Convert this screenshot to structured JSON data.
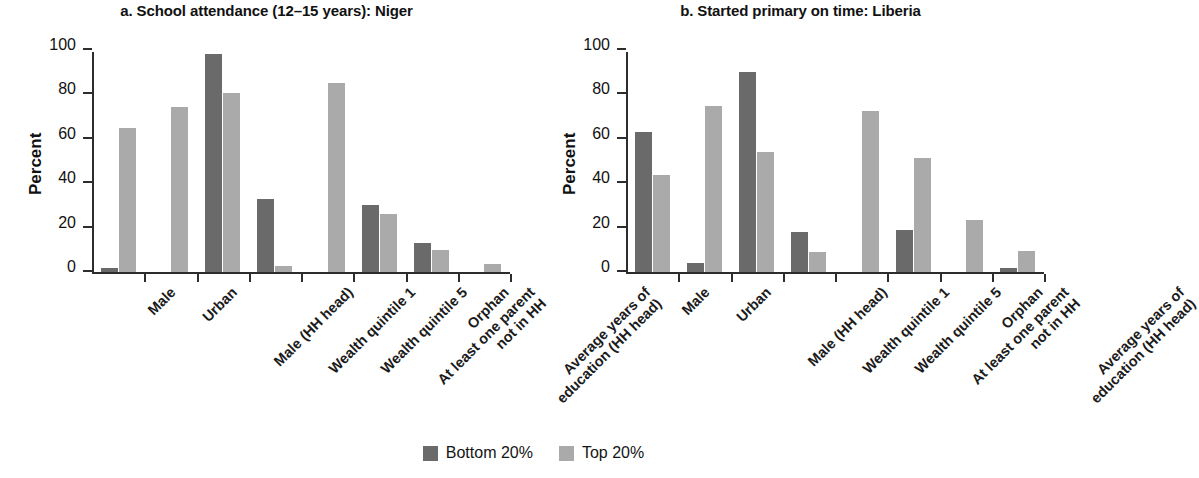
{
  "figure": {
    "legend": {
      "position": "bottom-center",
      "items": [
        {
          "label": "Bottom 20%",
          "color": "#6a6a6a",
          "key": "bottom20"
        },
        {
          "label": "Top 20%",
          "color": "#aaaaaa",
          "key": "top20"
        }
      ]
    }
  },
  "chart_data": [
    {
      "type": "bar",
      "panel": "a",
      "title": "a. School attendance (12–15 years): Niger",
      "xlabel": "",
      "ylabel": "Percent",
      "ylim": [
        0,
        100
      ],
      "yticks": [
        0,
        20,
        40,
        60,
        80,
        100
      ],
      "ytick_labels": [
        "0",
        "20",
        "40",
        "60",
        "80",
        "100"
      ],
      "grid": false,
      "legend_position": "bottom-center",
      "categories": [
        "Male",
        "Urban",
        "Male (HH head)",
        "Wealth quintile 1",
        "Wealth quintile 5",
        "At least one parent\nnot in HH",
        "Orphan",
        "Average years of\neducation (HH head)"
      ],
      "series": [
        {
          "name": "Bottom 20%",
          "color": "#6a6a6a",
          "values": [
            2,
            0,
            98,
            33,
            0,
            30,
            13,
            0
          ]
        },
        {
          "name": "Top 20%",
          "color": "#aaaaaa",
          "values": [
            65,
            74.5,
            80.5,
            2.5,
            85,
            26,
            10,
            3.5
          ]
        }
      ]
    },
    {
      "type": "bar",
      "panel": "b",
      "title": "b. Started primary on time: Liberia",
      "xlabel": "",
      "ylabel": "Percent",
      "ylim": [
        0,
        100
      ],
      "yticks": [
        0,
        20,
        40,
        60,
        80,
        100
      ],
      "ytick_labels": [
        "0",
        "20",
        "40",
        "60",
        "80",
        "100"
      ],
      "grid": false,
      "legend_position": "bottom-center",
      "categories": [
        "Male",
        "Urban",
        "Male (HH head)",
        "Wealth quintile 1",
        "Wealth quintile 5",
        "At least one parent\nnot in HH",
        "Orphan",
        "Average years of\neducation (HH head)"
      ],
      "series": [
        {
          "name": "Bottom 20%",
          "color": "#6a6a6a",
          "values": [
            63,
            4,
            90,
            18,
            0,
            19,
            0,
            2
          ]
        },
        {
          "name": "Top 20%",
          "color": "#aaaaaa",
          "values": [
            43.5,
            75,
            54,
            9,
            72.5,
            51.5,
            23.5,
            9.5
          ]
        }
      ]
    }
  ]
}
